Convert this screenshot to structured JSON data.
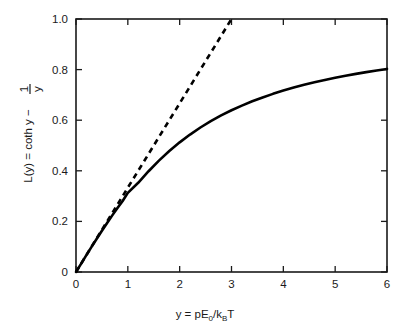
{
  "figure": {
    "background_color": "#ffffff",
    "line_color": "#000000",
    "axis_color": "#1a1a1a"
  },
  "chart_data": {
    "type": "line",
    "title": "",
    "subtitle": "",
    "xlabel": "y = pE0/kBT",
    "xlabel_parts": {
      "lead": "y = pE",
      "sub1": "0",
      "mid": "/k",
      "sub2": "B",
      "tail": "T"
    },
    "ylabel": "L(y) = coth y − 1/y",
    "ylabel_parts": {
      "lead": "L(y) = coth y − ",
      "fraction_numerator": "1",
      "fraction_denominator": "y"
    },
    "xlim": [
      0,
      6
    ],
    "ylim": [
      0,
      1.0
    ],
    "xticks": [
      0,
      1,
      2,
      3,
      4,
      5,
      6
    ],
    "xtick_labels": [
      "0",
      "1",
      "2",
      "3",
      "4",
      "5",
      "6"
    ],
    "yticks": [
      0,
      0.2,
      0.4,
      0.6,
      0.8,
      1.0
    ],
    "ytick_labels": [
      "0",
      "0.2",
      "0.4",
      "0.6",
      "0.8",
      "1.0"
    ],
    "grid": false,
    "legend": false,
    "legend_position": "none",
    "tick_direction": "in",
    "frame": "box",
    "series": [
      {
        "name": "Langevin function L(y) = coth y - 1/y",
        "style": "solid",
        "color": "#000000",
        "x": [
          0,
          0.1,
          0.2,
          0.3,
          0.4,
          0.5,
          0.6,
          0.7,
          0.8,
          0.9,
          1.0,
          1.2,
          1.4,
          1.6,
          1.8,
          2.0,
          2.2,
          2.4,
          2.6,
          2.8,
          3.0,
          3.2,
          3.4,
          3.6,
          3.8,
          4.0,
          4.2,
          4.4,
          4.6,
          4.8,
          5.0,
          5.2,
          5.4,
          5.6,
          5.8,
          6.0
        ],
        "y": [
          0,
          0.0333,
          0.0665,
          0.0993,
          0.1315,
          0.1631,
          0.1938,
          0.2238,
          0.2527,
          0.2806,
          0.313,
          0.3526,
          0.3983,
          0.4401,
          0.478,
          0.5124,
          0.5433,
          0.5711,
          0.5962,
          0.6188,
          0.6393,
          0.6578,
          0.6747,
          0.69,
          0.7041,
          0.717,
          0.7288,
          0.7397,
          0.7498,
          0.7591,
          0.7677,
          0.7757,
          0.7832,
          0.7901,
          0.7966,
          0.8027
        ]
      },
      {
        "name": "Linear approximation L ≈ y/3",
        "style": "dashed",
        "color": "#000000",
        "x": [
          0,
          3.0
        ],
        "y": [
          0,
          1.0
        ]
      }
    ],
    "annotations": []
  }
}
